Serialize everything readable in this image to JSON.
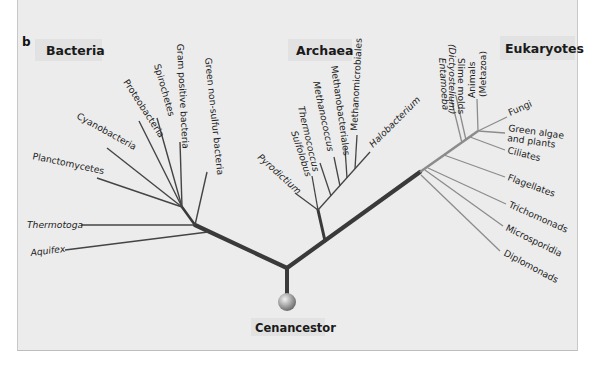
{
  "caption_partial": "karyotes are not discussed in this chapter, and we also...",
  "panel_letter": "b",
  "domains": {
    "bacteria": "Bacteria",
    "archaea": "Archaea",
    "eukaryotes": "Eukaryotes"
  },
  "root_label": "Cenancestor",
  "bacteria_taxa": [
    "Green non-sulfur bacteria",
    "Gram positive bacteria",
    "Spirochetes",
    "Proteobacteria",
    "Cyanobacteria",
    "Planctomycetes",
    "Thermotoga",
    "Aquifex"
  ],
  "archaea_taxa": [
    "Pyrodictium",
    "Sulfolobus",
    "Thermococcus",
    "Methanococcus",
    "Methanobacteriales",
    "Methanomicrobiales",
    "Halobacterium"
  ],
  "eukaryote_taxa": [
    "Entamoeba",
    "Slime molds",
    "(Dictyostelium)",
    "Animals",
    "(Metazoa)",
    "Fungi",
    "Green algae",
    "and plants",
    "Ciliates",
    "Flagellates",
    "Trichomonads",
    "Microsporidia",
    "Diplomonads"
  ],
  "colors": {
    "panel_bg": "#ececec",
    "trunk": "#3a3a3a",
    "branch": "#444444",
    "eukaryote_branch": "#8c8c8c",
    "label_box": "#e2e2e2"
  }
}
